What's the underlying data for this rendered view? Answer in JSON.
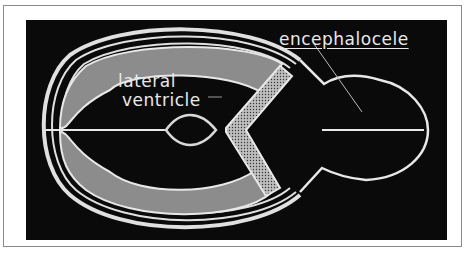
{
  "figure": {
    "type": "medical-illustration",
    "labels": {
      "lateral_ventricle_line1": "lateral",
      "lateral_ventricle_line2": "ventricle",
      "encephalocele": "encephalocele"
    },
    "colors": {
      "background": "#0a0a0a",
      "outline": "#e8e8e8",
      "ventricle_fill": "#8c8c8c",
      "stipple": "#cfcfcf",
      "frame": "#8a8a8a"
    }
  }
}
